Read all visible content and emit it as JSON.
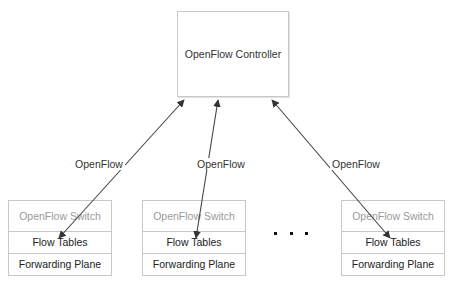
{
  "controller": {
    "label": "OpenFlow Controller"
  },
  "links": [
    {
      "label": "OpenFlow"
    },
    {
      "label": "OpenFlow"
    },
    {
      "label": "OpenFlow"
    }
  ],
  "switches": [
    {
      "header": "OpenFlow Switch",
      "tables": "Flow Tables",
      "plane": "Forwarding Plane"
    },
    {
      "header": "OpenFlow Switch",
      "tables": "Flow Tables",
      "plane": "Forwarding Plane"
    },
    {
      "header": "OpenFlow Switch",
      "tables": "Flow Tables",
      "plane": "Forwarding Plane"
    }
  ],
  "ellipsis": "...",
  "colors": {
    "border": "#c8c8c8",
    "arrow": "#444444",
    "muted_text": "#9a9a9a"
  }
}
